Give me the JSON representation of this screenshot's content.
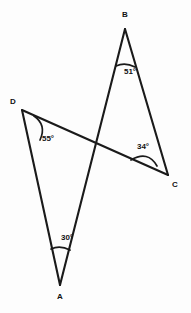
{
  "figure": {
    "type": "geometry-diagram",
    "background_color": "#fdfdfd",
    "stroke_color": "#1a1a1a"
  },
  "vertices": [
    {
      "id": "A",
      "label": "A",
      "label_x": 60,
      "label_y": 297,
      "point_x": 60,
      "point_y": 285
    },
    {
      "id": "B",
      "label": "B",
      "label_x": 125,
      "label_y": 15,
      "point_x": 125,
      "point_y": 29
    },
    {
      "id": "C",
      "label": "C",
      "label_x": 175,
      "label_y": 185,
      "point_x": 168,
      "point_y": 175
    },
    {
      "id": "D",
      "label": "D",
      "label_x": 13,
      "label_y": 102,
      "point_x": 22,
      "point_y": 110
    }
  ],
  "segments": [
    {
      "id": "DC",
      "from": "D",
      "to": "C",
      "x1": 22,
      "y1": 110,
      "x2": 168,
      "y2": 175
    },
    {
      "id": "AB",
      "from": "A",
      "to": "B",
      "x1": 60,
      "y1": 285,
      "x2": 125,
      "y2": 29
    },
    {
      "id": "DA",
      "from": "D",
      "to": "A",
      "x1": 22,
      "y1": 110,
      "x2": 60,
      "y2": 285
    },
    {
      "id": "BC",
      "from": "B",
      "to": "C",
      "x1": 125,
      "y1": 29,
      "x2": 168,
      "y2": 175
    }
  ],
  "intersection": {
    "x": 97,
    "y": 143
  },
  "angles": [
    {
      "at": "B",
      "value": "51",
      "unit": "°",
      "text": "51°",
      "label_x": 130,
      "label_y": 72
    },
    {
      "at": "C",
      "value": "34",
      "unit": "°",
      "text": "34°",
      "label_x": 143,
      "label_y": 147
    },
    {
      "at": "D",
      "value": "55",
      "unit": "°",
      "text": "55°",
      "label_x": 48,
      "label_y": 139
    },
    {
      "at": "A",
      "value": "30",
      "unit": "°",
      "text": "30°",
      "label_x": 67,
      "label_y": 238
    }
  ],
  "arcs": [
    {
      "at": "B",
      "d": "M 116 66 Q 125 62 135 67"
    },
    {
      "at": "C",
      "d": "M 131 160 Q 148 150 157 166"
    },
    {
      "at": "D",
      "d": "M 34 116 Q 47 125 40 140"
    },
    {
      "at": "A",
      "d": "M 51 249 Q 60 245 70 250"
    }
  ]
}
